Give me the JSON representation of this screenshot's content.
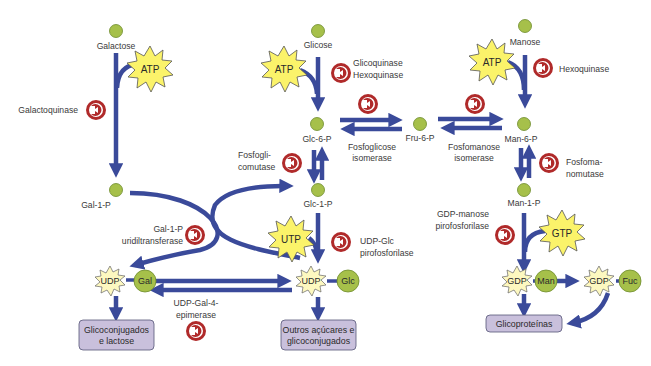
{
  "diagram": {
    "type": "metabolic-pathway",
    "colors": {
      "arrow": "#3a4a9a",
      "metabolite": "#a6c04a",
      "metabolite_stroke": "#6c8a2a",
      "cofactor": "#fbf36a",
      "cofactor_stroke": "#555555",
      "nucleotide": "#fdf8c0",
      "enzyme_ring": "#b02a2a",
      "box_fill": "#c9c0dc",
      "box_stroke": "#555577",
      "text": "#3a3a3a"
    },
    "metabolites": {
      "galactose": "Galactose",
      "glicose": "Glicose",
      "manose": "Manose",
      "glc6p": "Glc-6-P",
      "fru6p": "Fru-6-P",
      "man6p": "Man-6-P",
      "gal1p": "Gal-1-P",
      "glc1p": "Glc-1-P",
      "man1p": "Man-1-P"
    },
    "cofactors": {
      "atp_gal": "ATP",
      "atp_glc": "ATP",
      "atp_man": "ATP",
      "utp": "UTP",
      "gtp": "GTP"
    },
    "nucleotide_sugars": {
      "udp_gal": {
        "nucleotide": "UDP",
        "sugar": "Gal"
      },
      "udp_glc": {
        "nucleotide": "UDP",
        "sugar": "Glc"
      },
      "gdp_man": {
        "nucleotide": "GDP",
        "sugar": "Man"
      },
      "gdp_fuc": {
        "nucleotide": "GDP",
        "sugar": "Fuc"
      }
    },
    "enzymes": {
      "galactoquinase": "Galactoquinase",
      "glicoquinase_l1": "Glicoquinase",
      "glicoquinase_l2": "Hexoquinase",
      "hexoquinase_man": "Hexoquinase",
      "fosfoglicose_l1": "Fosfoglicose",
      "fosfoglicose_l2": "isomerase",
      "fosfomanose_l1": "Fosfomanose",
      "fosfomanose_l2": "isomerase",
      "fosfoglicomutase_l1": "Fosfogli-",
      "fosfoglicomutase_l2": "comutase",
      "fosfomanomutase_l1": "Fosfoma-",
      "fosfomanomutase_l2": "nomutase",
      "gal1p_ut_l1": "Gal-1-P",
      "gal1p_ut_l2": "uridiltransferase",
      "udpglc_pp_l1": "UDP-Glc",
      "udpglc_pp_l2": "pirofosforilase",
      "gdpman_pp_l1": "GDP-manose",
      "gdpman_pp_l2": "pirofosforilase",
      "epimerase_l1": "UDP-Gal-4-",
      "epimerase_l2": "epimerase"
    },
    "products": {
      "glicoconjugados_l1": "Glicoconjugados",
      "glicoconjugados_l2": "e lactose",
      "outros_l1": "Outros açúcares e",
      "outros_l2": "glicoconjugados",
      "glicoproteinas": "Glicoproteínas"
    }
  }
}
